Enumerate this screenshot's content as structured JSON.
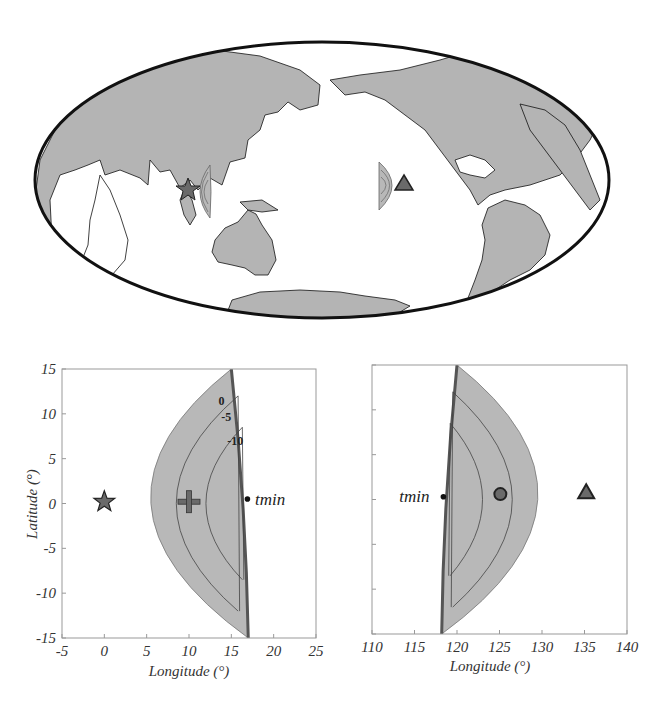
{
  "colors": {
    "land": "#b4b4b4",
    "region_fill": "#b8b8b8",
    "region_edge": "#555555",
    "contour": "#444444",
    "frame": "#999999",
    "marker_fill": "#6a6a6a",
    "marker_edge": "#222222",
    "text": "#333333"
  },
  "map": {
    "projection": "Hammer-Aitoff (Pacific-centered)",
    "center_longitude": 180,
    "markers": [
      {
        "name": "source-star",
        "shape": "star",
        "lon": 103,
        "lat": 0
      },
      {
        "name": "station-triangle",
        "shape": "triangle",
        "lon": -135,
        "lat": 0
      }
    ],
    "regions": [
      {
        "name": "region-near-source",
        "near": "source-star"
      },
      {
        "name": "region-near-station",
        "near": "station-triangle"
      }
    ]
  },
  "chart_data": [
    {
      "type": "scatter",
      "title": "",
      "xlabel": "Longitude  (°)",
      "ylabel": "Latitude (°)",
      "xlim": [
        -5,
        25
      ],
      "ylim": [
        -15,
        15
      ],
      "xticks": [
        -5,
        0,
        5,
        10,
        15,
        20,
        25
      ],
      "yticks": [
        -15,
        -10,
        -5,
        0,
        5,
        10,
        15
      ],
      "xtick_labels": [
        "-5",
        "0",
        "5",
        "10",
        "15",
        "20",
        "25"
      ],
      "ytick_labels": [
        "-15",
        "-10",
        "-5",
        "0",
        "5",
        "10",
        "15"
      ],
      "grid": false,
      "region": {
        "outer_boundary": {
          "straight_edge_lon": [
            15,
            17
          ],
          "straight_edge_lat": [
            15,
            -15
          ],
          "apex_lon": 5.5
        },
        "contours": [
          {
            "label": "0",
            "value": 0,
            "apex_lon": 5.5,
            "lat_extent": 15,
            "edge_lon": 15
          },
          {
            "label": "-5",
            "value": -5,
            "apex_lon": 8.5,
            "lat_extent": 12,
            "edge_lon": 15.8
          },
          {
            "label": "-10",
            "value": -10,
            "apex_lon": 12,
            "lat_extent": 8.5,
            "edge_lon": 16.3
          }
        ]
      },
      "points": [
        {
          "name": "source-star",
          "shape": "star",
          "x": 0,
          "y": 0.2
        },
        {
          "name": "centroid-plus",
          "shape": "plus",
          "x": 10,
          "y": 0.2
        },
        {
          "name": "tmin-point",
          "shape": "dot",
          "x": 16.9,
          "y": 0.5
        }
      ],
      "annotations": [
        {
          "text": "tmin",
          "x": 17.8,
          "y": 0.5
        },
        {
          "text": "0",
          "x": 14.2,
          "y": 11.4
        },
        {
          "text": "-5",
          "x": 15.0,
          "y": 9.6
        },
        {
          "text": "-10",
          "x": 16.4,
          "y": 7.0
        }
      ]
    },
    {
      "type": "scatter",
      "title": "",
      "xlabel": "Longitude  (°)",
      "ylabel": "",
      "xlim": [
        110,
        140
      ],
      "ylim": [
        -15,
        15
      ],
      "xticks": [
        110,
        115,
        120,
        125,
        130,
        135,
        140
      ],
      "yticks": [
        -15,
        -10,
        -5,
        0,
        5,
        10,
        15
      ],
      "xtick_labels": [
        "110",
        "115",
        "120",
        "125",
        "130",
        "135",
        "140"
      ],
      "ytick_labels": [],
      "grid": false,
      "region": {
        "outer_boundary": {
          "straight_edge_lon": [
            120,
            118.2
          ],
          "straight_edge_lat": [
            15,
            -15
          ],
          "apex_lon": 129.5
        },
        "contours": [
          {
            "value": 0,
            "apex_lon": 129.5,
            "lat_extent": 15,
            "edge_lon": 120.3
          },
          {
            "value": -5,
            "apex_lon": 126.5,
            "lat_extent": 12,
            "edge_lon": 119.5
          },
          {
            "value": -10,
            "apex_lon": 123,
            "lat_extent": 8.5,
            "edge_lon": 119.2
          }
        ]
      },
      "points": [
        {
          "name": "centroid-circle",
          "shape": "circle",
          "x": 125.1,
          "y": 0.6
        },
        {
          "name": "station-triangle",
          "shape": "triangle",
          "x": 135.2,
          "y": 0.8
        },
        {
          "name": "tmin-point",
          "shape": "dot",
          "x": 118.4,
          "y": 0.3
        }
      ],
      "annotations": [
        {
          "text": "tmin",
          "x": 113.2,
          "y": 0.4
        }
      ]
    }
  ]
}
